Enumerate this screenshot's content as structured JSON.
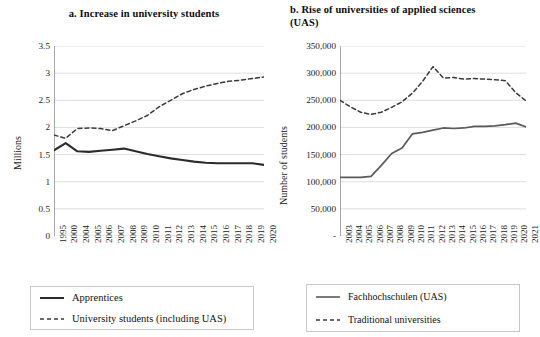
{
  "figure": {
    "background": "#ffffff",
    "line_color_solid": "#2b2b2b",
    "line_color_dashed": "#3a3a3a",
    "grid_color": "#d5d5d5",
    "axis_color": "#555555"
  },
  "chart_data": [
    {
      "panel": "a",
      "type": "line",
      "title": "a. Increase in university students",
      "xlabel": "",
      "ylabel": "Millions",
      "ylim": [
        0,
        3.5
      ],
      "yticks": [
        "0",
        "0.5",
        "1",
        "1.5",
        "2",
        "2.5",
        "3",
        "3.5"
      ],
      "ytick_values": [
        0,
        0.5,
        1,
        1.5,
        2,
        2.5,
        3,
        3.5
      ],
      "grid": true,
      "legend_position": "below",
      "categories": [
        "1995",
        "2000",
        "2004",
        "2005",
        "2006",
        "2007",
        "2008",
        "2009",
        "2010",
        "2011",
        "2012",
        "2013",
        "2014",
        "2015",
        "2016",
        "2017",
        "2018",
        "2019",
        "2020"
      ],
      "series": [
        {
          "name": "Apprentices",
          "style": "solid",
          "values": [
            1.58,
            1.71,
            1.56,
            1.55,
            1.57,
            1.59,
            1.61,
            1.56,
            1.51,
            1.47,
            1.43,
            1.4,
            1.37,
            1.35,
            1.34,
            1.34,
            1.34,
            1.34,
            1.31
          ]
        },
        {
          "name": "University students (including UAS)",
          "style": "dashed",
          "values": [
            1.86,
            1.8,
            1.98,
            1.99,
            1.98,
            1.94,
            2.03,
            2.12,
            2.22,
            2.38,
            2.5,
            2.62,
            2.7,
            2.76,
            2.81,
            2.85,
            2.87,
            2.9,
            2.93
          ]
        }
      ]
    },
    {
      "panel": "b",
      "type": "line",
      "title": "b. Rise of universities of applied sciences (UAS)",
      "xlabel": "",
      "ylabel": "Number of students",
      "ylim": [
        0,
        350000
      ],
      "yticks": [
        "-",
        "50,000",
        "100,000",
        "150,000",
        "200,000",
        "250,000",
        "300,000",
        "350,000"
      ],
      "ytick_values": [
        0,
        50000,
        100000,
        150000,
        200000,
        250000,
        300000,
        350000
      ],
      "grid": true,
      "legend_position": "below",
      "categories": [
        "2003",
        "2004",
        "2005",
        "2006",
        "2007",
        "2008",
        "2009",
        "2010",
        "2011",
        "2012",
        "2013",
        "2014",
        "2015",
        "2016",
        "2017",
        "2018",
        "2019",
        "2020",
        "2021"
      ],
      "series": [
        {
          "name": "Fachhochschulen (UAS)",
          "style": "solid",
          "values": [
            108000,
            108000,
            108000,
            110000,
            130000,
            152000,
            162000,
            188000,
            191000,
            195000,
            199000,
            198000,
            199000,
            202000,
            202000,
            203000,
            205000,
            208000,
            201000
          ]
        },
        {
          "name": "Traditional universities",
          "style": "dashed",
          "values": [
            250000,
            238000,
            228000,
            224000,
            228000,
            237000,
            247000,
            263000,
            285000,
            312000,
            291000,
            292000,
            289000,
            290000,
            289000,
            288000,
            286000,
            264000,
            249000
          ]
        }
      ]
    }
  ],
  "panel_a": {
    "title": "a. Increase in university students",
    "ylabel": "Millions",
    "yticks": [
      "3.5",
      "3",
      "2.5",
      "2",
      "1.5",
      "1",
      "0.5",
      "0"
    ],
    "xticks": [
      "1995",
      "2000",
      "2004",
      "2005",
      "2006",
      "2007",
      "2008",
      "2009",
      "2010",
      "2011",
      "2012",
      "2013",
      "2014",
      "2015",
      "2016",
      "2017",
      "2018",
      "2019",
      "2020"
    ],
    "legend": [
      {
        "label": "Apprentices",
        "style": "solid"
      },
      {
        "label": "University students (including UAS)",
        "style": "dashed"
      }
    ]
  },
  "panel_b": {
    "title": "b. Rise of universities of applied sciences (UAS)",
    "ylabel": "Number of students",
    "yticks": [
      "350,000",
      "300,000",
      "250,000",
      "200,000",
      "150,000",
      "100,000",
      "50,000",
      "-"
    ],
    "xticks": [
      "2003",
      "2004",
      "2005",
      "2006",
      "2007",
      "2008",
      "2009",
      "2010",
      "2011",
      "2012",
      "2013",
      "2014",
      "2015",
      "2016",
      "2017",
      "2018",
      "2019",
      "2020",
      "2021"
    ],
    "legend": [
      {
        "label": "Fachhochschulen (UAS)",
        "style": "solid"
      },
      {
        "label": "Traditional universities",
        "style": "dashed"
      }
    ]
  }
}
